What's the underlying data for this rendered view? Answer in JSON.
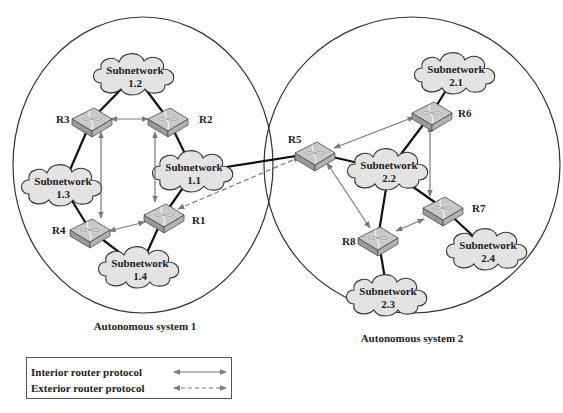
{
  "autonomous_systems": [
    {
      "id": "as1",
      "label": "Autonomous system 1",
      "cx": 143,
      "cy": 165,
      "rx": 130,
      "ry": 148,
      "label_x": 145,
      "label_y": 330
    },
    {
      "id": "as2",
      "label": "Autonomous system 2",
      "cx": 412,
      "cy": 165,
      "rx": 148,
      "ry": 148,
      "label_x": 412,
      "label_y": 342
    }
  ],
  "subnetworks": [
    {
      "id": "1.1",
      "line1": "Subnetwork",
      "line2": "1.1",
      "cx": 194,
      "cy": 172
    },
    {
      "id": "1.2",
      "line1": "Subnetwork",
      "line2": "1.2",
      "cx": 135,
      "cy": 75
    },
    {
      "id": "1.3",
      "line1": "Subnetwork",
      "line2": "1.3",
      "cx": 63,
      "cy": 186
    },
    {
      "id": "1.4",
      "line1": "Subnetwork",
      "line2": "1.4",
      "cx": 140,
      "cy": 268
    },
    {
      "id": "2.1",
      "line1": "Subnetwork",
      "line2": "2.1",
      "cx": 456,
      "cy": 74
    },
    {
      "id": "2.2",
      "line1": "Subnetwork",
      "line2": "2.2",
      "cx": 389,
      "cy": 170
    },
    {
      "id": "2.3",
      "line1": "Subnetwork",
      "line2": "2.3",
      "cx": 388,
      "cy": 296
    },
    {
      "id": "2.4",
      "line1": "Subnetwork",
      "line2": "2.4",
      "cx": 488,
      "cy": 250
    }
  ],
  "routers": [
    {
      "id": "R1",
      "label": "R1",
      "cx": 164,
      "cy": 215,
      "lx": 192,
      "ly": 224
    },
    {
      "id": "R2",
      "label": "R2",
      "cx": 168,
      "cy": 119,
      "lx": 199,
      "ly": 123
    },
    {
      "id": "R3",
      "label": "R3",
      "cx": 92,
      "cy": 119,
      "lx": 56,
      "ly": 123
    },
    {
      "id": "R4",
      "label": "R4",
      "cx": 90,
      "cy": 230,
      "lx": 52,
      "ly": 234
    },
    {
      "id": "R5",
      "label": "R5",
      "cx": 315,
      "cy": 153,
      "lx": 288,
      "ly": 143
    },
    {
      "id": "R6",
      "label": "R6",
      "cx": 432,
      "cy": 113,
      "lx": 458,
      "ly": 117
    },
    {
      "id": "R7",
      "label": "R7",
      "cx": 443,
      "cy": 208,
      "lx": 472,
      "ly": 212
    },
    {
      "id": "R8",
      "label": "R8",
      "cx": 378,
      "cy": 238,
      "lx": 342,
      "ly": 245
    }
  ],
  "links": [
    [
      "1.2",
      "R3"
    ],
    [
      "1.2",
      "R2"
    ],
    [
      "R2",
      "1.1"
    ],
    [
      "R3",
      "1.3"
    ],
    [
      "1.3",
      "R4"
    ],
    [
      "R4",
      "1.4"
    ],
    [
      "1.4",
      "R1"
    ],
    [
      "R1",
      "1.1"
    ],
    [
      "1.1",
      "R5"
    ],
    [
      "R5",
      "2.2"
    ],
    [
      "2.1",
      "R6"
    ],
    [
      "R6",
      "2.2"
    ],
    [
      "2.2",
      "R7"
    ],
    [
      "2.2",
      "R8"
    ],
    [
      "R7",
      "2.4"
    ],
    [
      "R8",
      "2.3"
    ]
  ],
  "interior_protocol_arrows": [
    [
      111,
      119,
      148,
      119
    ],
    [
      101,
      132,
      101,
      218
    ],
    [
      155,
      132,
      155,
      202
    ],
    [
      109,
      231,
      145,
      222
    ],
    [
      334,
      148,
      414,
      117
    ],
    [
      327,
      163,
      370,
      228
    ],
    [
      430,
      126,
      430,
      196
    ],
    [
      396,
      231,
      424,
      219
    ]
  ],
  "exterior_protocol_arrows": [
    [
      300,
      157,
      178,
      209
    ]
  ],
  "legend": {
    "items": [
      {
        "label": "Interior router protocol",
        "style": "solid"
      },
      {
        "label": "Exterior router protocol",
        "style": "dashed"
      }
    ]
  },
  "colors": {
    "cloud_fill": "#e3e3e3",
    "cloud_stroke": "#333333",
    "router_top": "#c9c9c9",
    "router_side": "#9a9a9a",
    "link": "#111111",
    "protocol_arrow": "#7a7a7a",
    "ellipse_stroke": "#333333"
  }
}
